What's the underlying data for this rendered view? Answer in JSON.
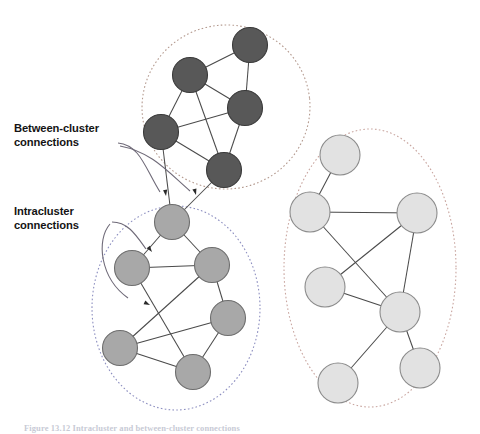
{
  "figure": {
    "caption": "Figure 13.12   Intracluster and between-cluster connections",
    "background_color": "#ffffff"
  },
  "annotations": [
    {
      "id": "between-cluster",
      "label": "Between-cluster\nconnections",
      "text_color": "#141414",
      "leader_color": "#6f6a78",
      "arrow_targets": [
        {
          "x": 166,
          "y": 196
        },
        {
          "x": 196,
          "y": 195
        }
      ]
    },
    {
      "id": "intracluster",
      "label": "Intracluster\nconnections",
      "text_color": "#141414",
      "leader_color": "#6f6a78",
      "arrow_targets": [
        {
          "x": 152,
          "y": 252
        },
        {
          "x": 150,
          "y": 305
        }
      ]
    }
  ],
  "clusters": [
    {
      "id": "cluster-top",
      "name": "top-cluster",
      "node_fill": "#585858",
      "node_stroke": "#3a3a3a",
      "boundary_color": "#b49a8f",
      "boundary": {
        "cx": 226,
        "cy": 107,
        "rx": 84,
        "ry": 82,
        "rotation": -6
      },
      "node_radius": 17.5,
      "nodes": [
        {
          "id": "t1",
          "x": 250,
          "y": 45
        },
        {
          "id": "t2",
          "x": 190,
          "y": 75
        },
        {
          "id": "t3",
          "x": 245,
          "y": 108
        },
        {
          "id": "t4",
          "x": 161,
          "y": 132
        },
        {
          "id": "t5",
          "x": 224,
          "y": 170
        }
      ],
      "edges": [
        [
          "t1",
          "t2"
        ],
        [
          "t1",
          "t3"
        ],
        [
          "t2",
          "t3"
        ],
        [
          "t2",
          "t4"
        ],
        [
          "t2",
          "t5"
        ],
        [
          "t3",
          "t4"
        ],
        [
          "t3",
          "t5"
        ],
        [
          "t4",
          "t5"
        ]
      ]
    },
    {
      "id": "cluster-middle",
      "name": "middle-cluster",
      "node_fill": "#a8a8a8",
      "node_stroke": "#6e6e6e",
      "boundary_color": "#8d8fc0",
      "boundary": {
        "cx": 176,
        "cy": 308,
        "rx": 84,
        "ry": 102,
        "rotation": 0
      },
      "node_radius": 17.5,
      "nodes": [
        {
          "id": "m0",
          "x": 172,
          "y": 222
        },
        {
          "id": "m1",
          "x": 132,
          "y": 268
        },
        {
          "id": "m2",
          "x": 212,
          "y": 265
        },
        {
          "id": "m3",
          "x": 228,
          "y": 318
        },
        {
          "id": "m4",
          "x": 120,
          "y": 348
        },
        {
          "id": "m5",
          "x": 193,
          "y": 372
        }
      ],
      "edges": [
        [
          "m0",
          "m1"
        ],
        [
          "m0",
          "m2"
        ],
        [
          "m1",
          "m2"
        ],
        [
          "m1",
          "m5"
        ],
        [
          "m2",
          "m3"
        ],
        [
          "m2",
          "m4"
        ],
        [
          "m3",
          "m4"
        ],
        [
          "m3",
          "m5"
        ],
        [
          "m4",
          "m5"
        ]
      ]
    },
    {
      "id": "cluster-right",
      "name": "right-cluster",
      "node_fill": "#e2e2e2",
      "node_stroke": "#8c8c8c",
      "boundary_color": "#c9a6a0",
      "boundary": {
        "cx": 370,
        "cy": 268,
        "rx": 86,
        "ry": 139,
        "rotation": 0
      },
      "node_radius": 20,
      "nodes": [
        {
          "id": "r1",
          "x": 340,
          "y": 155
        },
        {
          "id": "r2",
          "x": 310,
          "y": 212
        },
        {
          "id": "r3",
          "x": 417,
          "y": 213
        },
        {
          "id": "r4",
          "x": 325,
          "y": 287
        },
        {
          "id": "r5",
          "x": 400,
          "y": 312
        },
        {
          "id": "r6",
          "x": 420,
          "y": 368
        },
        {
          "id": "r7",
          "x": 338,
          "y": 383
        }
      ],
      "edges": [
        [
          "r1",
          "r2"
        ],
        [
          "r2",
          "r3"
        ],
        [
          "r2",
          "r5"
        ],
        [
          "r3",
          "r4"
        ],
        [
          "r3",
          "r5"
        ],
        [
          "r4",
          "r5"
        ],
        [
          "r5",
          "r6"
        ],
        [
          "r5",
          "r7"
        ]
      ]
    }
  ],
  "inter_cluster_edges": [
    {
      "from_cluster": "cluster-top",
      "from": "t4",
      "to_cluster": "cluster-middle",
      "to": "m0"
    },
    {
      "from_cluster": "cluster-top",
      "from": "t5",
      "to_cluster": "cluster-middle",
      "to": "m0"
    }
  ],
  "edge_style": {
    "color": "#4a4a4a",
    "width": 1.05
  }
}
